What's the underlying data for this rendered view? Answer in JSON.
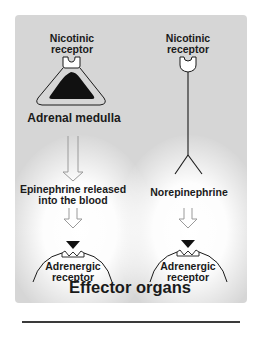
{
  "diagram": {
    "left_pathway": {
      "receptor_label_line1": "Nicotinic",
      "receptor_label_line2": "receptor",
      "organ_label": "Adrenal medulla",
      "release_label_line1": "Epinephrine released",
      "release_label_line2": "into the blood",
      "target_label_line1": "Adrenergic",
      "target_label_line2": "receptor"
    },
    "right_pathway": {
      "receptor_label_line1": "Nicotinic",
      "receptor_label_line2": "receptor",
      "release_label": "Norepinephrine",
      "target_label_line1": "Adrenergic",
      "target_label_line2": "receptor"
    },
    "footer_label": "Effector organs"
  },
  "colors": {
    "panel": "#d6d6d6",
    "ink": "#1a1a1a",
    "arrow_outline": "#9a9a9a",
    "glow": "#ffffff"
  }
}
